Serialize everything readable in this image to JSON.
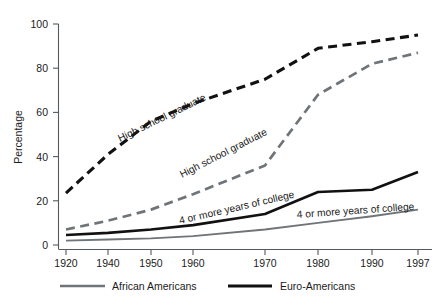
{
  "chart_data": {
    "type": "line",
    "title": "",
    "xlabel": "",
    "ylabel": "Percentage",
    "ylim": [
      0,
      100
    ],
    "yticks": [
      0,
      20,
      40,
      60,
      80,
      100
    ],
    "yticklabels": [
      "0",
      "20",
      "40",
      "60",
      "80",
      "100"
    ],
    "x": [
      1920,
      1940,
      1950,
      1960,
      1970,
      1980,
      1990,
      1997
    ],
    "xticklabels": [
      "1920",
      "1940",
      "1950",
      "1960",
      "1970",
      "1980",
      "1990",
      "1997"
    ],
    "grid": false,
    "legend_position": "bottom",
    "series": [
      {
        "name": "High school graduate — Euro-Americans",
        "group": "Euro-Americans",
        "measure": "High school graduate",
        "style": "black-dashed",
        "color": "#111111",
        "values": [
          23.5,
          41,
          56,
          64,
          75,
          89,
          92,
          95
        ]
      },
      {
        "name": "High school graduate — African Americans",
        "group": "African Americans",
        "measure": "High school graduate",
        "style": "gray-dashed",
        "color": "#6f7478",
        "values": [
          7,
          11,
          16,
          23,
          36,
          68,
          82,
          87
        ]
      },
      {
        "name": "4 or more years of college — Euro-Americans",
        "group": "Euro-Americans",
        "measure": "4 or more years of college",
        "style": "black-solid",
        "color": "#111111",
        "values": [
          4.5,
          5.5,
          7,
          9,
          14,
          24,
          25,
          33
        ]
      },
      {
        "name": "4 or more years of college — African Americans",
        "group": "African Americans",
        "measure": "4 or more years of college",
        "style": "gray-solid",
        "color": "#6f7478",
        "values": [
          2,
          2.5,
          3,
          4,
          7,
          10,
          13,
          16
        ]
      }
    ],
    "annotations": [
      {
        "text": "High school graduate",
        "x": 120,
        "y": 142,
        "rotate": -26
      },
      {
        "text": "High school graduate",
        "x": 182,
        "y": 178,
        "rotate": -27
      },
      {
        "text": "4 or more years of college",
        "x": 180,
        "y": 224,
        "rotate": -13
      },
      {
        "text": "4 or more years of college",
        "x": 297,
        "y": 218,
        "rotate": -4
      }
    ],
    "legend": [
      {
        "label": "African Americans",
        "color": "#6f7478",
        "style": "solid"
      },
      {
        "label": "Euro-Americans",
        "color": "#111111",
        "style": "solid"
      }
    ]
  }
}
